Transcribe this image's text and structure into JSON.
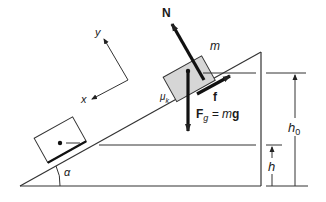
{
  "diagram": {
    "labels": {
      "normal_force": "N",
      "friction": "f",
      "gravity_F": "F",
      "gravity_sub": "g",
      "gravity_eq": " = m",
      "gravity_g": "g",
      "mass": "m",
      "mu": "μ",
      "mu_sub": "k",
      "axis_x": "x",
      "axis_y": "y",
      "angle": "α",
      "height_initial": "h",
      "height_initial_sub": "0",
      "height_final": "h"
    },
    "colors": {
      "line": "#222222",
      "block_fill": "#d6d6d6",
      "block_outline": "#333333",
      "background": "#ffffff"
    }
  }
}
